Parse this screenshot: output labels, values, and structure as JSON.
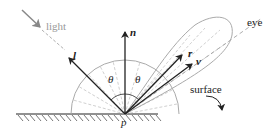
{
  "diagram": {
    "labels": {
      "light": "light",
      "l": "l",
      "n": "n",
      "r": "r",
      "v": "v",
      "theta1": "θ",
      "theta2": "θ",
      "p": "p",
      "eye": "eye",
      "surface": "surface"
    },
    "colors": {
      "ink": "#222222",
      "light_arrow": "#888888",
      "lobe": "#aaaaaa",
      "dashed": "#bbbbbb"
    }
  }
}
